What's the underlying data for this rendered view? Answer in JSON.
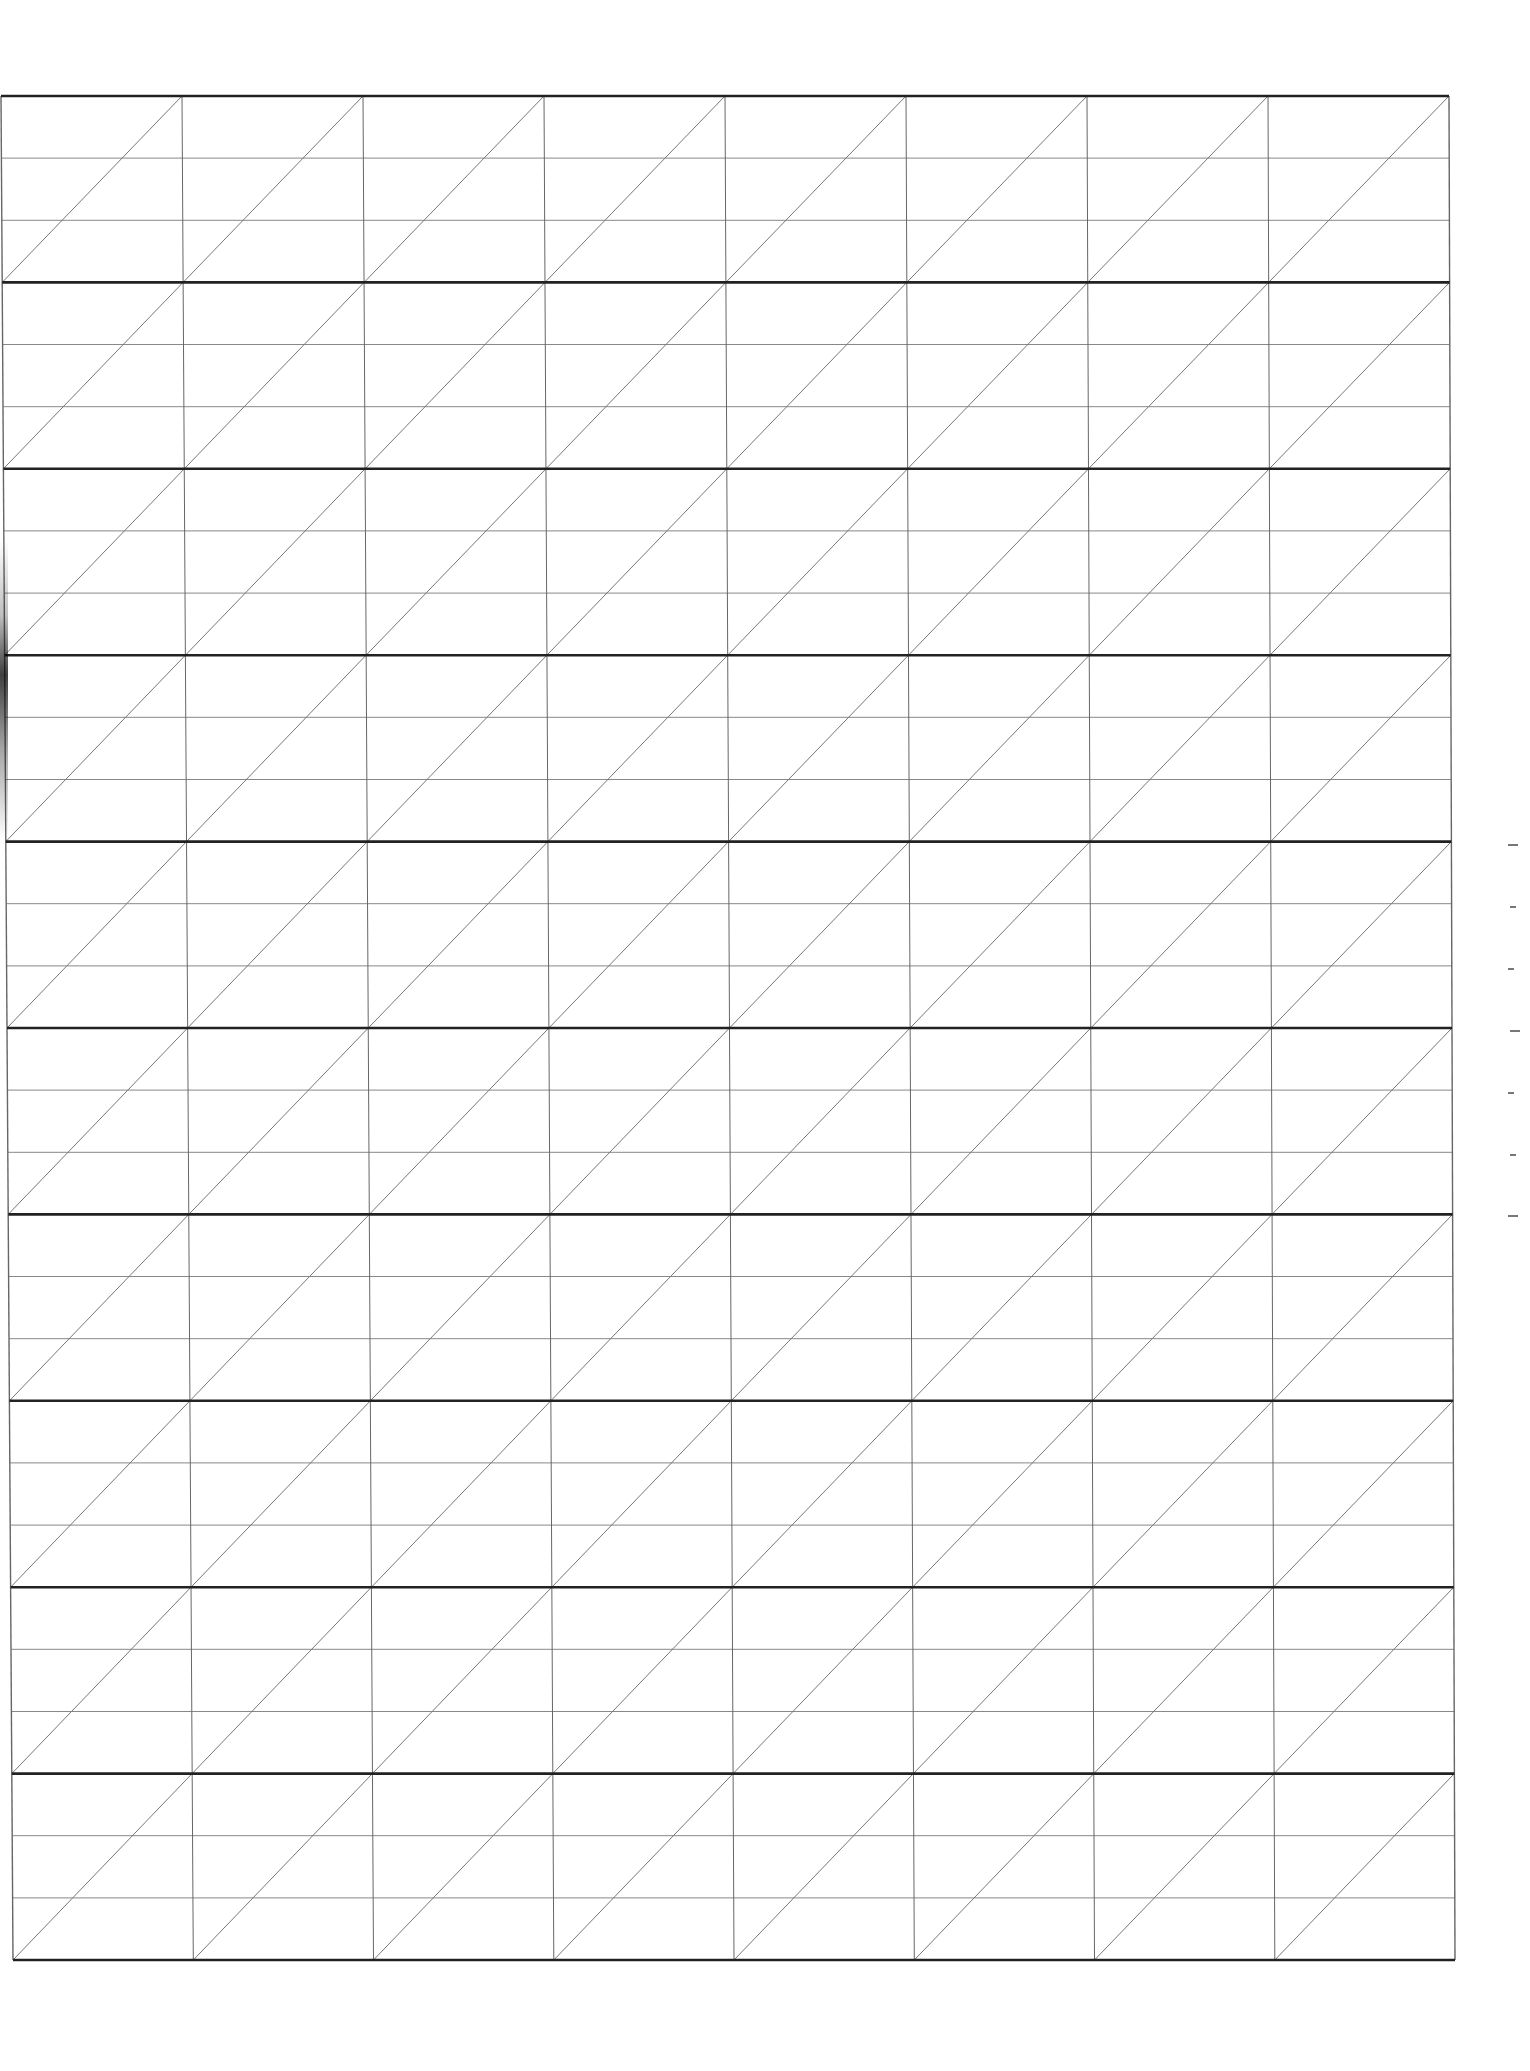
{
  "sheet": {
    "type": "calligraphy-practice-grid",
    "background": "#ffffff",
    "band_count": 10,
    "subrows_per_band": 3,
    "column_count": 8,
    "diagonal_direction": "bottom-left-to-top-right",
    "colors": {
      "band_line": "#222222",
      "subrow_line": "#888888",
      "column_line": "#666666",
      "diagonal_line": "#777777"
    },
    "geometry": {
      "top_left": [
        1,
        96
      ],
      "top_right": [
        1449,
        96
      ],
      "bottom_left": [
        13,
        1960
      ],
      "bottom_right": [
        1455,
        1960
      ]
    }
  },
  "margin_ticks": {
    "x": 1508,
    "ys": [
      844,
      906,
      968,
      1030,
      1092,
      1154,
      1215
    ]
  }
}
